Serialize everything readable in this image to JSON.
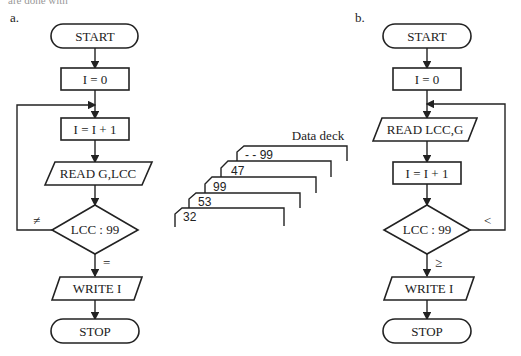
{
  "top_fragment": "are done with",
  "flowchart_a": {
    "label": "a.",
    "start": "START",
    "init": "I = 0",
    "increment": "I = I + 1",
    "read": "READ G,LCC",
    "decision": "LCC : 99",
    "loop_condition": "≠",
    "exit_condition": "=",
    "write": "WRITE I",
    "stop": "STOP"
  },
  "data_deck": {
    "title": "Data deck",
    "cards": [
      "32",
      "53",
      "99",
      "47",
      "- - 99"
    ]
  },
  "flowchart_b": {
    "label": "b.",
    "start": "START",
    "init": "I = 0",
    "read": "READ LCC,G",
    "increment": "I = I + 1",
    "decision": "LCC : 99",
    "loop_condition": "<",
    "exit_condition": "≥",
    "write": "WRITE I",
    "stop": "STOP"
  }
}
